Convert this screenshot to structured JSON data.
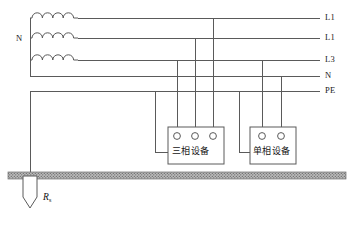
{
  "diagram": {
    "source_label": "N",
    "earth_resistance_symbol": "R",
    "earth_resistance_subscript": "s",
    "colors": {
      "wire": "#5a5a5a",
      "text": "#1a1a1a",
      "ground": "#8d8d8d",
      "background": "#ffffff"
    },
    "rails": [
      {
        "id": "rail-l1",
        "label": "L1",
        "y": 18
      },
      {
        "id": "rail-l2",
        "label": "L1",
        "y": 38
      },
      {
        "id": "rail-l3",
        "label": "L3",
        "y": 60
      },
      {
        "id": "rail-n",
        "label": "N",
        "y": 76
      },
      {
        "id": "rail-pe",
        "label": "PE",
        "y": 91
      }
    ],
    "transformer": {
      "winding_count": 3,
      "arcs_per_winding": 4,
      "neutral_label": "N"
    },
    "loads": [
      {
        "id": "three-phase-load",
        "label": "三相设备",
        "terminals": 3,
        "x": 168,
        "y": 127,
        "width": 56,
        "height": 37
      },
      {
        "id": "single-phase-load",
        "label": "单相设备",
        "terminals": 2,
        "x": 250,
        "y": 127,
        "width": 46,
        "height": 37
      }
    ],
    "earth_electrode": {
      "label_prefix": "R",
      "label_subscript": "s",
      "ground_level_y": 174
    }
  }
}
